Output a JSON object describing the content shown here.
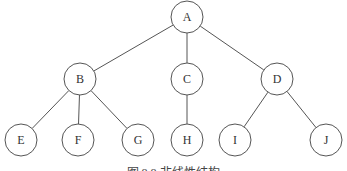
{
  "diagram": {
    "type": "tree",
    "caption": "图 8.8  非线性结构",
    "nodes": [
      {
        "id": "A",
        "label": "A",
        "x": 187,
        "y": 17
      },
      {
        "id": "B",
        "label": "B",
        "x": 80,
        "y": 79
      },
      {
        "id": "C",
        "label": "C",
        "x": 187,
        "y": 79
      },
      {
        "id": "D",
        "label": "D",
        "x": 277,
        "y": 79
      },
      {
        "id": "E",
        "label": "E",
        "x": 21,
        "y": 140
      },
      {
        "id": "F",
        "label": "F",
        "x": 78,
        "y": 140
      },
      {
        "id": "G",
        "label": "G",
        "x": 138,
        "y": 140
      },
      {
        "id": "H",
        "label": "H",
        "x": 187,
        "y": 140
      },
      {
        "id": "I",
        "label": "I",
        "x": 235,
        "y": 140
      },
      {
        "id": "J",
        "label": "J",
        "x": 326,
        "y": 140
      }
    ],
    "edges": [
      [
        "A",
        "B"
      ],
      [
        "A",
        "C"
      ],
      [
        "A",
        "D"
      ],
      [
        "B",
        "E"
      ],
      [
        "B",
        "F"
      ],
      [
        "B",
        "G"
      ],
      [
        "C",
        "H"
      ],
      [
        "D",
        "I"
      ],
      [
        "D",
        "J"
      ]
    ],
    "node_radius": 16
  }
}
